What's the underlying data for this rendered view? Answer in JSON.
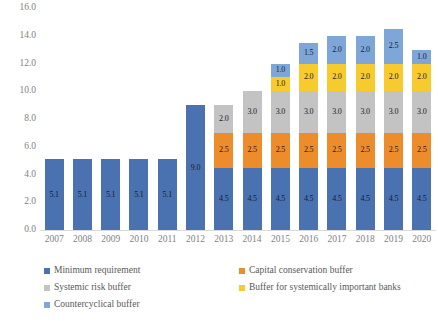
{
  "chart_data": {
    "type": "bar",
    "stacked": true,
    "title": "",
    "subtitle": "",
    "xlabel": "",
    "ylabel": "",
    "ylim": [
      0.0,
      16.0
    ],
    "ytick_step": 2.0,
    "grid": false,
    "legend_position": "bottom",
    "legend_columns": 2,
    "categories": [
      "2007",
      "2008",
      "2009",
      "2010",
      "2011",
      "2012",
      "2013",
      "2014",
      "2015",
      "2016",
      "2017",
      "2018",
      "2019",
      "2020"
    ],
    "ytick_labels": [
      "0.0",
      "2.0",
      "4.0",
      "6.0",
      "8.0",
      "10.0",
      "12.0",
      "14.0",
      "16.0"
    ],
    "ytick_values": [
      0.0,
      2.0,
      4.0,
      6.0,
      8.0,
      10.0,
      12.0,
      14.0,
      16.0
    ],
    "series": [
      {
        "name": "Minimum requirement",
        "color": "#4a72b0",
        "values": [
          5.1,
          5.1,
          5.1,
          5.1,
          5.1,
          9.0,
          4.5,
          4.5,
          4.5,
          4.5,
          4.5,
          4.5,
          4.5,
          4.5
        ],
        "labels": [
          "5.1",
          "5.1",
          "5.1",
          "5.1",
          "5.1",
          "9.0",
          "4.5",
          "4.5",
          "4.5",
          "4.5",
          "4.5",
          "4.5",
          "4.5",
          "4.5"
        ]
      },
      {
        "name": "Capital conservation buffer",
        "color": "#ed8c2b",
        "values": [
          0,
          0,
          0,
          0,
          0,
          0,
          2.5,
          2.5,
          2.5,
          2.5,
          2.5,
          2.5,
          2.5,
          2.5
        ],
        "labels": [
          "",
          "",
          "",
          "",
          "",
          "",
          "2.5",
          "2.5",
          "2.5",
          "2.5",
          "2.5",
          "2.5",
          "2.5",
          "2.5"
        ]
      },
      {
        "name": "Systemic risk buffer",
        "color": "#c3c3c3",
        "values": [
          0,
          0,
          0,
          0,
          0,
          0,
          2.0,
          3.0,
          3.0,
          3.0,
          3.0,
          3.0,
          3.0,
          3.0
        ],
        "labels": [
          "",
          "",
          "",
          "",
          "",
          "",
          "2.0",
          "3.0",
          "3.0",
          "3.0",
          "3.0",
          "3.0",
          "3.0",
          "3.0"
        ]
      },
      {
        "name": "Buffer for systemically important banks",
        "color": "#f7cb2d",
        "values": [
          0,
          0,
          0,
          0,
          0,
          0,
          0,
          0,
          1.0,
          2.0,
          2.0,
          2.0,
          2.0,
          2.0
        ],
        "labels": [
          "",
          "",
          "",
          "",
          "",
          "",
          "",
          "",
          "1.0",
          "2.0",
          "2.0",
          "2.0",
          "2.0",
          "2.0"
        ]
      },
      {
        "name": "Countercyclical buffer",
        "color": "#7fa6d8",
        "values": [
          0,
          0,
          0,
          0,
          0,
          0,
          0,
          0,
          1.0,
          1.5,
          2.0,
          2.0,
          2.5,
          1.0
        ],
        "labels": [
          "",
          "",
          "",
          "",
          "",
          "",
          "",
          "",
          "1.0",
          "1.5",
          "2.0",
          "2.0",
          "2.5",
          "1.0"
        ]
      }
    ],
    "totals": [
      5.1,
      5.1,
      5.1,
      5.1,
      5.1,
      9.0,
      9.0,
      10.0,
      12.0,
      13.5,
      14.0,
      14.0,
      14.5,
      13.0
    ]
  }
}
